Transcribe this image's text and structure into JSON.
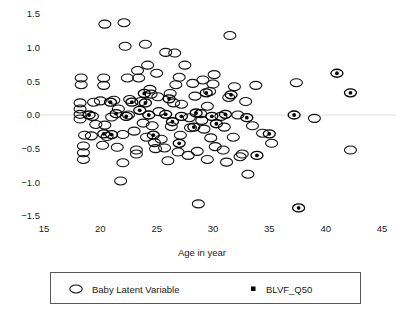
{
  "chart_data": {
    "type": "scatter",
    "title": "",
    "xlabel": "Age in year",
    "ylabel": "",
    "xlim": [
      15,
      45
    ],
    "ylim": [
      -1.5,
      1.5
    ],
    "xticks": [
      15,
      20,
      25,
      30,
      35,
      40,
      45
    ],
    "xtick_labels": [
      "15",
      "20",
      "25",
      "30",
      "35",
      "40",
      "45"
    ],
    "yticks": [
      -1.5,
      -1.0,
      -0.5,
      0.0,
      0.5,
      1.0,
      1.5
    ],
    "ytick_labels": [
      "-1.5",
      "-1.0",
      "-0.5",
      "0.0",
      "0.5",
      "1.0",
      "1.5"
    ],
    "grid": false,
    "zeroline": true,
    "legend_position": "below-outside",
    "series": [
      {
        "name": "Baby Latent Variable",
        "marker": "open-ellipse",
        "color": "#111111",
        "points": [
          [
            20.4,
            1.35
          ],
          [
            22.1,
            1.37
          ],
          [
            22.2,
            1.02
          ],
          [
            24.0,
            1.05
          ],
          [
            25.8,
            0.93
          ],
          [
            26.6,
            0.92
          ],
          [
            24.2,
            0.74
          ],
          [
            23.3,
            0.66
          ],
          [
            27.5,
            0.74
          ],
          [
            31.5,
            1.18
          ],
          [
            18.3,
            0.55
          ],
          [
            18.3,
            0.45
          ],
          [
            20.3,
            0.55
          ],
          [
            20.3,
            0.44
          ],
          [
            22.4,
            0.55
          ],
          [
            23.4,
            0.55
          ],
          [
            25.0,
            0.62
          ],
          [
            27.0,
            0.56
          ],
          [
            29.1,
            0.52
          ],
          [
            30.0,
            0.46
          ],
          [
            30.1,
            0.6
          ],
          [
            24.4,
            0.38
          ],
          [
            24.5,
            0.31
          ],
          [
            25.1,
            0.27
          ],
          [
            26.2,
            0.32
          ],
          [
            28.4,
            0.28
          ],
          [
            29.7,
            0.35
          ],
          [
            31.4,
            0.26
          ],
          [
            18.2,
            0.18
          ],
          [
            18.2,
            0.09
          ],
          [
            18.2,
            0.01
          ],
          [
            18.2,
            -0.06
          ],
          [
            19.4,
            0.19
          ],
          [
            20.0,
            0.21
          ],
          [
            21.2,
            0.22
          ],
          [
            22.6,
            0.23
          ],
          [
            23.6,
            0.2
          ],
          [
            26.5,
            0.18
          ],
          [
            27.2,
            0.16
          ],
          [
            29.5,
            0.13
          ],
          [
            19.3,
            -0.02
          ],
          [
            21.0,
            -0.03
          ],
          [
            22.5,
            0.0
          ],
          [
            25.2,
            0.05
          ],
          [
            27.9,
            -0.04
          ],
          [
            28.9,
            0.02
          ],
          [
            30.7,
            -0.02
          ],
          [
            32.2,
            0.0
          ],
          [
            19.6,
            -0.14
          ],
          [
            20.4,
            -0.15
          ],
          [
            23.8,
            -0.12
          ],
          [
            24.6,
            -0.16
          ],
          [
            26.3,
            -0.17
          ],
          [
            28.0,
            -0.19
          ],
          [
            29.2,
            -0.21
          ],
          [
            31.0,
            -0.18
          ],
          [
            18.6,
            -0.3
          ],
          [
            19.2,
            -0.31
          ],
          [
            20.6,
            -0.32
          ],
          [
            22.0,
            -0.29
          ],
          [
            24.1,
            -0.33
          ],
          [
            25.4,
            -0.36
          ],
          [
            27.1,
            -0.3
          ],
          [
            29.8,
            -0.34
          ],
          [
            31.8,
            -0.33
          ],
          [
            18.5,
            -0.46
          ],
          [
            18.5,
            -0.56
          ],
          [
            18.5,
            -0.66
          ],
          [
            20.2,
            -0.45
          ],
          [
            21.5,
            -0.48
          ],
          [
            23.2,
            -0.52
          ],
          [
            23.2,
            -0.58
          ],
          [
            24.9,
            -0.5
          ],
          [
            25.7,
            -0.49
          ],
          [
            26.9,
            -0.55
          ],
          [
            27.8,
            -0.6
          ],
          [
            28.6,
            -0.54
          ],
          [
            30.2,
            -0.47
          ],
          [
            30.9,
            -0.52
          ],
          [
            32.6,
            -0.58
          ],
          [
            22.0,
            -0.71
          ],
          [
            26.0,
            -0.68
          ],
          [
            29.5,
            -0.66
          ],
          [
            31.2,
            -0.7
          ],
          [
            21.8,
            -0.98
          ],
          [
            33.1,
            -0.88
          ],
          [
            28.7,
            -1.32
          ],
          [
            33.5,
            -0.16
          ],
          [
            42.2,
            -0.52
          ],
          [
            37.4,
            0.48
          ],
          [
            39.0,
            -0.05
          ],
          [
            34.4,
            -0.27
          ],
          [
            35.2,
            -0.42
          ],
          [
            32.9,
            0.2
          ],
          [
            33.8,
            0.44
          ],
          [
            31.9,
            0.42
          ],
          [
            32.4,
            -0.62
          ],
          [
            26.7,
            0.45
          ],
          [
            28.2,
            0.47
          ],
          [
            29.0,
            -0.08
          ],
          [
            21.6,
            0.09
          ],
          [
            23.0,
            -0.24
          ],
          [
            24.8,
            -0.41
          ]
        ]
      },
      {
        "name": "BLVF_Q50",
        "marker": "filled-dot-in-ellipse",
        "color": "#000000",
        "points": [
          [
            20.9,
            0.19
          ],
          [
            22.8,
            0.19
          ],
          [
            24.0,
            0.18
          ],
          [
            21.4,
            0.02
          ],
          [
            25.8,
            0.01
          ],
          [
            27.2,
            -0.02
          ],
          [
            23.5,
            0.07
          ],
          [
            24.3,
            0.0
          ],
          [
            20.3,
            -0.28
          ],
          [
            21.0,
            -0.29
          ],
          [
            28.5,
            0.03
          ],
          [
            29.9,
            -0.02
          ],
          [
            31.1,
            0.01
          ],
          [
            26.4,
            -0.1
          ],
          [
            30.3,
            -0.13
          ],
          [
            23.9,
            0.32
          ],
          [
            29.4,
            0.33
          ],
          [
            31.6,
            0.3
          ],
          [
            27.0,
            -0.42
          ],
          [
            33.0,
            -0.04
          ],
          [
            41.0,
            0.62
          ],
          [
            42.2,
            0.33
          ],
          [
            37.2,
            0.0
          ],
          [
            37.6,
            -1.38
          ],
          [
            35.0,
            -0.28
          ],
          [
            33.9,
            -0.6
          ],
          [
            19.0,
            0.0
          ],
          [
            22.3,
            -0.02
          ],
          [
            26.1,
            0.24
          ],
          [
            24.7,
            -0.3
          ],
          [
            28.3,
            -0.18
          ]
        ]
      }
    ]
  },
  "legend": {
    "entries": [
      {
        "label": "Baby Latent Variable",
        "marker": "open-ellipse"
      },
      {
        "label": "BLVF_Q50",
        "marker": "small-filled-square"
      }
    ]
  }
}
